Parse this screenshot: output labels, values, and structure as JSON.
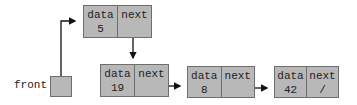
{
  "diagram": {
    "type": "linked-list",
    "front": {
      "label": "front"
    },
    "nodes": [
      {
        "data_label": "data",
        "next_label": "next",
        "value": "5",
        "next": ""
      },
      {
        "data_label": "data",
        "next_label": "next",
        "value": "19",
        "next": ""
      },
      {
        "data_label": "data",
        "next_label": "next",
        "value": "8",
        "next": ""
      },
      {
        "data_label": "data",
        "next_label": "next",
        "value": "42",
        "next": "/"
      }
    ],
    "colors": {
      "node_fill": "#b8b8b8",
      "border": "#6e6e6e",
      "arrow": "#111111"
    }
  }
}
